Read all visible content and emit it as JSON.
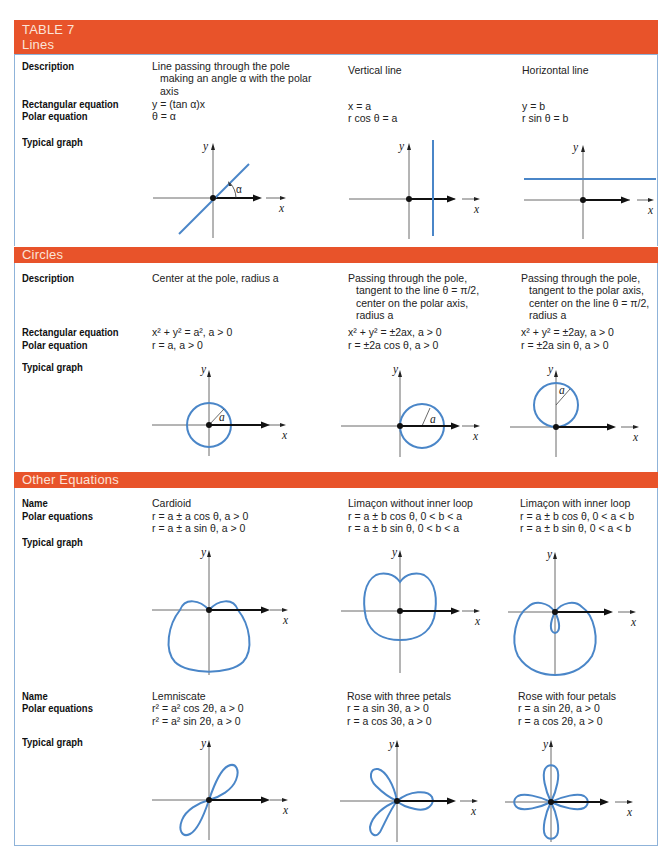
{
  "table_title": "TABLE 7",
  "colors": {
    "header_bar": "#e8532a",
    "header_text": "#fbe3d8",
    "border": "#8fb3d9",
    "curve": "#4a86c8",
    "axis": "#333333"
  },
  "sections": [
    {
      "title": "Lines",
      "row_labels": {
        "description": "Description",
        "rect": "Rectangular equation",
        "polar": "Polar equation",
        "graph": "Typical graph"
      },
      "columns": [
        {
          "description": [
            "Line passing through the pole",
            "making an angle α with the polar",
            "axis"
          ],
          "rect": "y = (tan α)x",
          "polar": "θ = α",
          "graph": "line-through-pole"
        },
        {
          "description": [
            "Vertical line"
          ],
          "rect": "x = a",
          "polar": "r cos θ = a",
          "graph": "vertical-line"
        },
        {
          "description": [
            "Horizontal line"
          ],
          "rect": "y = b",
          "polar": "r sin θ = b",
          "graph": "horizontal-line"
        }
      ],
      "graph_annotation": "α"
    },
    {
      "title": "Circles",
      "row_labels": {
        "description": "Description",
        "rect": "Rectangular equation",
        "polar": "Polar equation",
        "graph": "Typical graph"
      },
      "columns": [
        {
          "description": [
            "Center at the pole, radius a"
          ],
          "rect": "x² + y² = a², a > 0",
          "polar": "r = a, a > 0",
          "graph": "circle-centered"
        },
        {
          "description": [
            "Passing through the pole,",
            "tangent to the line θ = π/2,",
            "center on the polar axis,",
            "radius a"
          ],
          "rect": "x² + y² = ±2ax, a > 0",
          "polar": "r = ±2a cos θ, a > 0",
          "graph": "circle-on-polar-axis"
        },
        {
          "description": [
            "Passing through the pole,",
            "tangent to the polar axis,",
            "center on the line θ = π/2,",
            "radius a"
          ],
          "rect": "x² + y² = ±2ay, a > 0",
          "polar": "r = ±2a sin θ, a > 0",
          "graph": "circle-on-y-axis"
        }
      ],
      "graph_annotation": "a"
    },
    {
      "title": "Other Equations",
      "row_labels": {
        "name": "Name",
        "polar": "Polar equations",
        "graph": "Typical graph"
      },
      "rows": [
        [
          {
            "name": "Cardioid",
            "polar": [
              "r = a ± a cos θ, a > 0",
              "r = a ± a sin θ, a > 0"
            ],
            "graph": "cardioid"
          },
          {
            "name": "Limaçon without inner loop",
            "polar": [
              "r = a ± b cos θ, 0 < b < a",
              "r = a ± b sin θ, 0 < b < a"
            ],
            "graph": "limacon"
          },
          {
            "name": "Limaçon with inner loop",
            "polar": [
              "r = a ± b cos θ, 0 < a < b",
              "r = a ± b sin θ, 0 < a < b"
            ],
            "graph": "limacon-inner-loop"
          }
        ],
        [
          {
            "name": "Lemniscate",
            "polar": [
              "r² = a² cos 2θ, a > 0",
              "r² = a² sin 2θ, a > 0"
            ],
            "graph": "lemniscate"
          },
          {
            "name": "Rose with three petals",
            "polar": [
              "r = a sin 3θ, a > 0",
              "r = a cos 3θ, a > 0"
            ],
            "graph": "rose-3"
          },
          {
            "name": "Rose with four petals",
            "polar": [
              "r = a sin 2θ, a > 0",
              "r = a cos 2θ, a > 0"
            ],
            "graph": "rose-4"
          }
        ]
      ]
    }
  ],
  "axis_labels": {
    "x": "x",
    "y": "y"
  }
}
